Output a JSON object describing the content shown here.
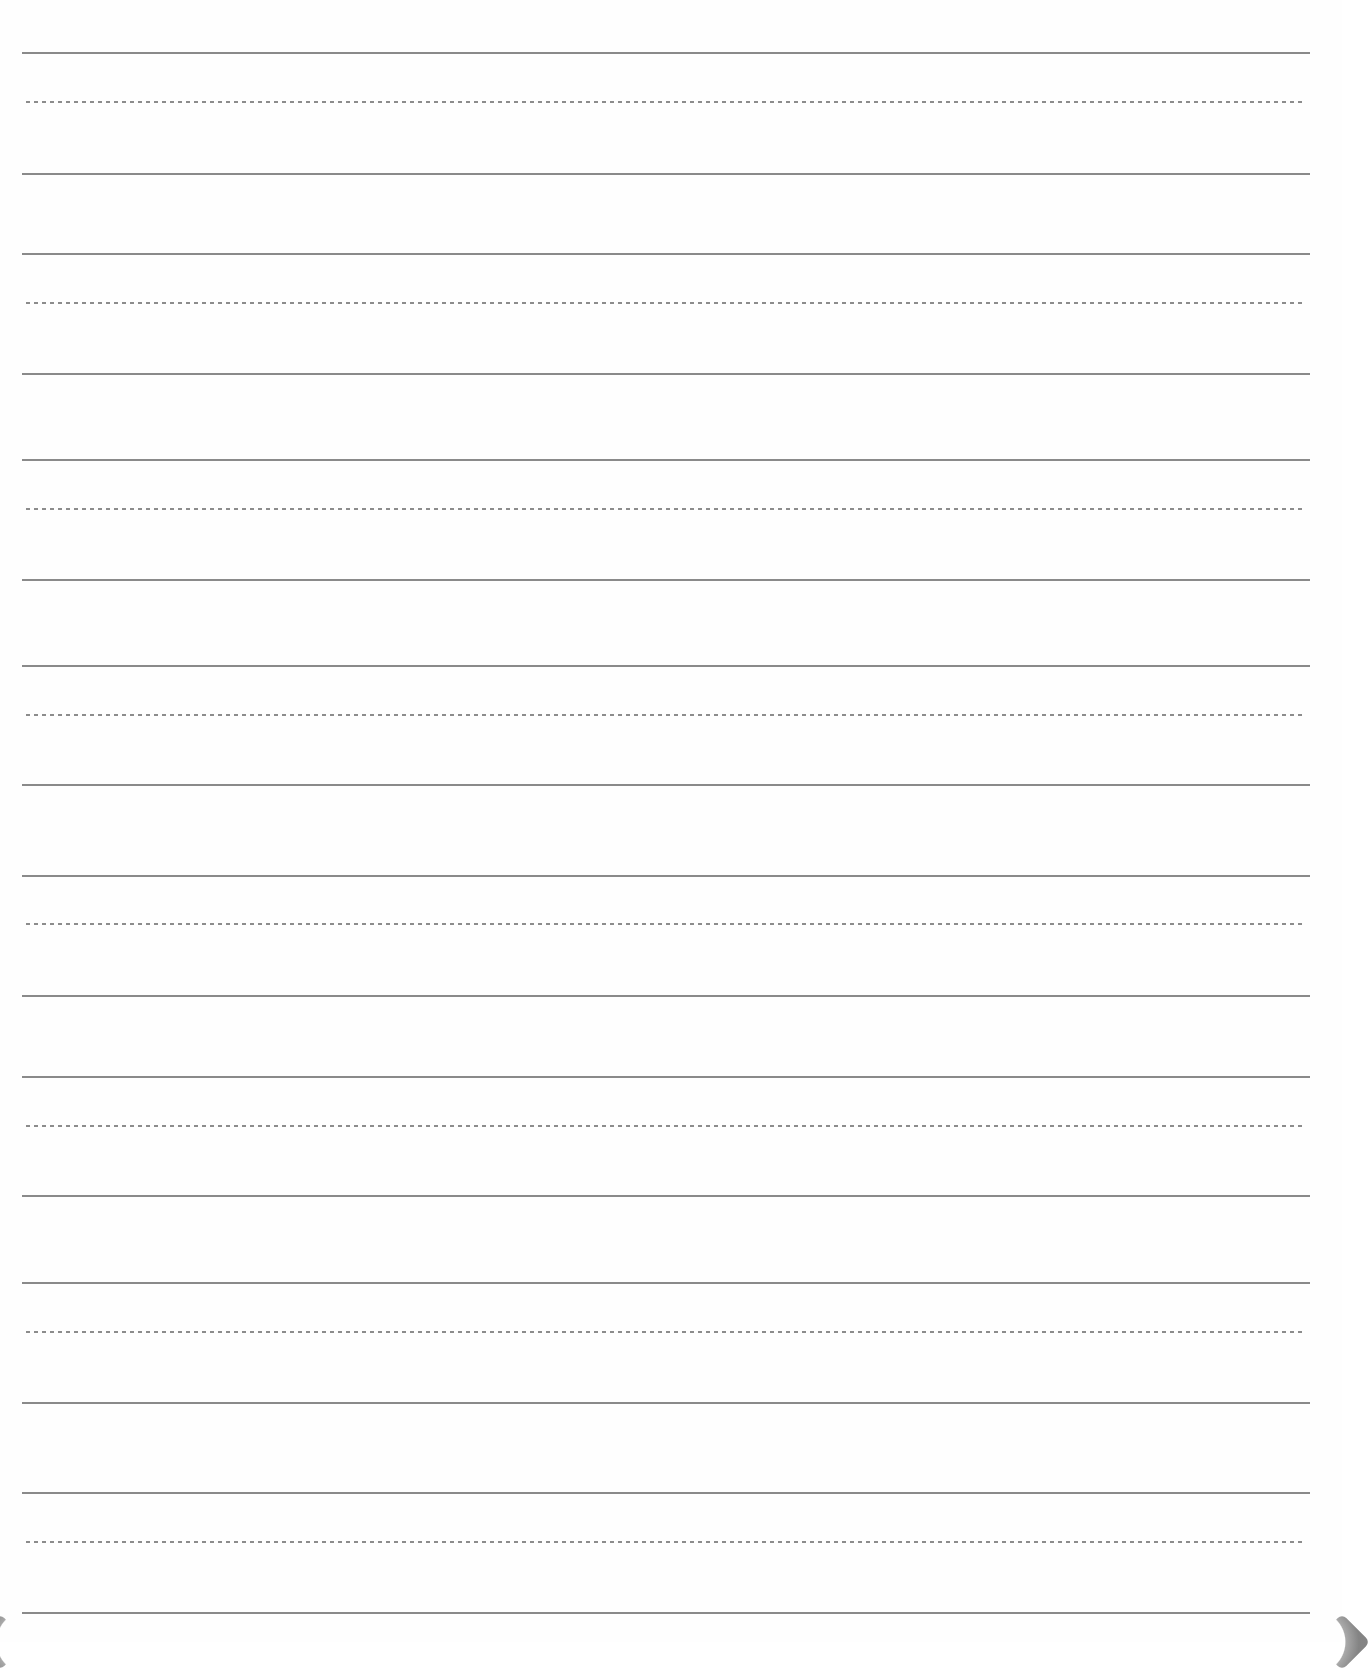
{
  "sheet": {
    "type": "handwriting-practice-paper",
    "background_color": "#fefefe",
    "line_color": "#8a8a8a",
    "dotted_line_color": "#8c8c8c",
    "line_left_x": 22,
    "line_right_x": 1310,
    "dotted_left_x": 26,
    "dotted_right_x": 1304,
    "groups": [
      {
        "top": 53,
        "mid": 102,
        "base": 174
      },
      {
        "top": 254,
        "mid": 303,
        "base": 374
      },
      {
        "top": 460,
        "mid": 509,
        "base": 580
      },
      {
        "top": 666,
        "mid": 715,
        "base": 785
      },
      {
        "top": 876,
        "mid": 924,
        "base": 996
      },
      {
        "top": 1077,
        "mid": 1126,
        "base": 1196
      },
      {
        "top": 1283,
        "mid": 1332,
        "base": 1403
      },
      {
        "top": 1493,
        "mid": 1542,
        "base": 1613
      }
    ],
    "corners": [
      "page-curl-bottom-left",
      "page-curl-bottom-right"
    ]
  }
}
